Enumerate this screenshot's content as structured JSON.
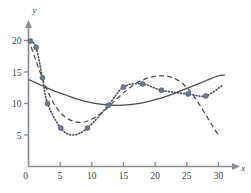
{
  "chart_data": {
    "type": "scatter",
    "title": "",
    "xlabel": "x",
    "ylabel": "y",
    "xlim": [
      0,
      31.5
    ],
    "ylim": [
      0,
      21.5
    ],
    "grid": false,
    "legend": "none",
    "xticks": [
      0,
      5,
      10,
      15,
      20,
      25,
      30
    ],
    "xtick_labels": [
      "0",
      "5",
      "10",
      "15",
      "20",
      "25",
      "30"
    ],
    "yticks": [
      5,
      10,
      15,
      20
    ],
    "ytick_labels": [
      "5",
      "10",
      "15",
      "20"
    ],
    "origin_label": "0",
    "marker_color": "#6b7a8f",
    "curve_color": "#4a4a55",
    "axis_color": "#8a8a92",
    "points": [
      {
        "x": 0.3,
        "y": 19.9
      },
      {
        "x": 1.2,
        "y": 18.9
      },
      {
        "x": 2.2,
        "y": 14.1
      },
      {
        "x": 3.0,
        "y": 10.0
      },
      {
        "x": 5.1,
        "y": 6.1
      },
      {
        "x": 9.3,
        "y": 6.1
      },
      {
        "x": 12.6,
        "y": 9.7
      },
      {
        "x": 15.0,
        "y": 12.6
      },
      {
        "x": 18.0,
        "y": 13.1
      },
      {
        "x": 21.0,
        "y": 12.1
      },
      {
        "x": 25.2,
        "y": 11.5
      },
      {
        "x": 28.0,
        "y": 11.2
      }
    ],
    "series": [
      {
        "name": "quadratic-fit",
        "style": "solid",
        "x": [
          0,
          2,
          4,
          6,
          8,
          10,
          12,
          14,
          16,
          18,
          20,
          22,
          24,
          26,
          28,
          30,
          31
        ],
        "y": [
          13.8,
          12.9,
          12.0,
          11.3,
          10.6,
          10.1,
          9.8,
          9.7,
          9.8,
          10.1,
          10.6,
          11.2,
          12.0,
          12.8,
          13.6,
          14.4,
          14.5
        ]
      },
      {
        "name": "polynomial-fit",
        "style": "dashed",
        "x": [
          0,
          1,
          2,
          3,
          4,
          5,
          6,
          7,
          8,
          9,
          10,
          11,
          12,
          13,
          14,
          15,
          16,
          17,
          18,
          19,
          20,
          21,
          22,
          23,
          24,
          25,
          26,
          27,
          28,
          29,
          30
        ],
        "y": [
          20.2,
          17.3,
          14.5,
          12.0,
          10.0,
          8.6,
          7.7,
          7.2,
          7.0,
          7.1,
          7.5,
          8.1,
          8.9,
          9.8,
          10.8,
          11.7,
          12.5,
          13.2,
          13.7,
          14.1,
          14.3,
          14.4,
          14.3,
          14.0,
          13.4,
          12.5,
          11.3,
          9.8,
          8.2,
          6.5,
          5.0
        ]
      },
      {
        "name": "interpolating-spline",
        "style": "dotted",
        "x": [
          0.3,
          1.2,
          2.2,
          3.0,
          5.1,
          7.0,
          9.3,
          12.6,
          15.0,
          18.0,
          21.0,
          25.2,
          28.0,
          30.5
        ],
        "y": [
          19.9,
          18.9,
          14.1,
          10.0,
          6.1,
          5.0,
          6.1,
          9.7,
          12.6,
          13.1,
          12.1,
          11.5,
          11.2,
          12.8
        ]
      }
    ]
  }
}
